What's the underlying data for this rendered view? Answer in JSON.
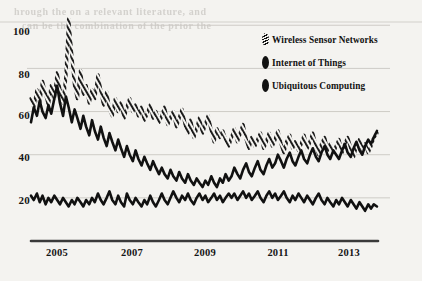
{
  "chart_data": {
    "type": "line",
    "title": "",
    "subtitle": "",
    "xlabel": "",
    "ylabel": "",
    "xlim": [
      2004.25,
      2014.2
    ],
    "ylim": [
      0,
      108
    ],
    "grid": true,
    "legend_position": "top-right",
    "x_tick_labels": [
      "2005",
      "2007",
      "2009",
      "2011",
      "2013"
    ],
    "x_tick_values": [
      2005,
      2007,
      2009,
      2011,
      2013
    ],
    "y_tick_labels": [
      "100",
      "80",
      "60",
      "40",
      "20"
    ],
    "y_tick_values": [
      100,
      80,
      60,
      40,
      20
    ],
    "x": [
      2004.25,
      2004.33,
      2004.42,
      2004.5,
      2004.58,
      2004.67,
      2004.75,
      2004.83,
      2004.92,
      2005.0,
      2005.08,
      2005.17,
      2005.25,
      2005.33,
      2005.42,
      2005.5,
      2005.58,
      2005.67,
      2005.75,
      2005.83,
      2005.92,
      2006.0,
      2006.08,
      2006.17,
      2006.25,
      2006.33,
      2006.42,
      2006.5,
      2006.58,
      2006.67,
      2006.75,
      2006.83,
      2006.92,
      2007.0,
      2007.08,
      2007.17,
      2007.25,
      2007.33,
      2007.42,
      2007.5,
      2007.58,
      2007.67,
      2007.75,
      2007.83,
      2007.92,
      2008.0,
      2008.08,
      2008.17,
      2008.25,
      2008.33,
      2008.42,
      2008.5,
      2008.58,
      2008.67,
      2008.75,
      2008.83,
      2008.92,
      2009.0,
      2009.08,
      2009.17,
      2009.25,
      2009.33,
      2009.42,
      2009.5,
      2009.58,
      2009.67,
      2009.75,
      2009.83,
      2009.92,
      2010.0,
      2010.08,
      2010.17,
      2010.25,
      2010.33,
      2010.42,
      2010.5,
      2010.58,
      2010.67,
      2010.75,
      2010.83,
      2010.92,
      2011.0,
      2011.08,
      2011.17,
      2011.25,
      2011.33,
      2011.42,
      2011.5,
      2011.58,
      2011.67,
      2011.75,
      2011.83,
      2011.92,
      2012.0,
      2012.08,
      2012.17,
      2012.25,
      2012.33,
      2012.42,
      2012.5,
      2012.58,
      2012.67,
      2012.75,
      2012.83,
      2012.92,
      2013.0,
      2013.08,
      2013.17,
      2013.25,
      2013.33,
      2013.42,
      2013.5,
      2013.58,
      2013.67,
      2013.75,
      2013.83,
      2013.92,
      2014.0,
      2014.08,
      2014.17
    ],
    "series": [
      {
        "name": "Wireless Sensor Networks",
        "style": "hatched",
        "values": [
          66,
          62,
          70,
          64,
          74,
          68,
          63,
          72,
          66,
          78,
          70,
          64,
          76,
          103,
          86,
          72,
          66,
          79,
          68,
          72,
          64,
          70,
          66,
          77,
          70,
          63,
          69,
          61,
          58,
          66,
          60,
          64,
          57,
          62,
          66,
          60,
          63,
          58,
          62,
          56,
          59,
          63,
          57,
          60,
          55,
          58,
          62,
          54,
          57,
          60,
          53,
          57,
          61,
          54,
          50,
          56,
          48,
          52,
          57,
          50,
          54,
          58,
          51,
          46,
          52,
          48,
          51,
          47,
          44,
          48,
          52,
          46,
          50,
          54,
          47,
          43,
          48,
          44,
          47,
          50,
          43,
          46,
          50,
          44,
          47,
          51,
          45,
          41,
          46,
          49,
          43,
          46,
          42,
          45,
          49,
          43,
          46,
          50,
          44,
          40,
          45,
          48,
          42,
          45,
          41,
          44,
          47,
          41,
          45,
          48,
          43,
          39,
          44,
          47,
          42,
          45,
          41,
          44,
          48,
          50
        ]
      },
      {
        "name": "Internet of Things",
        "style": "solid",
        "values": [
          55,
          62,
          58,
          65,
          60,
          57,
          63,
          59,
          66,
          72,
          64,
          58,
          67,
          62,
          55,
          61,
          57,
          52,
          58,
          53,
          49,
          56,
          51,
          47,
          53,
          48,
          44,
          50,
          46,
          42,
          47,
          43,
          39,
          44,
          40,
          37,
          42,
          38,
          35,
          39,
          36,
          33,
          37,
          34,
          31,
          34,
          31,
          29,
          33,
          30,
          28,
          32,
          29,
          27,
          31,
          28,
          26,
          29,
          27,
          25,
          28,
          26,
          30,
          27,
          25,
          29,
          27,
          31,
          28,
          30,
          34,
          31,
          29,
          33,
          36,
          32,
          30,
          34,
          37,
          33,
          31,
          35,
          38,
          34,
          36,
          40,
          37,
          34,
          38,
          41,
          37,
          35,
          39,
          42,
          38,
          36,
          40,
          43,
          39,
          37,
          41,
          44,
          40,
          38,
          42,
          40,
          38,
          42,
          45,
          41,
          39,
          43,
          46,
          42,
          40,
          44,
          47,
          45,
          48,
          51
        ]
      },
      {
        "name": "Ubiquitous Computing",
        "style": "solid",
        "values": [
          21,
          19,
          22,
          18,
          21,
          17,
          20,
          18,
          21,
          19,
          17,
          20,
          18,
          16,
          19,
          17,
          20,
          18,
          16,
          19,
          17,
          20,
          18,
          22,
          19,
          17,
          20,
          23,
          19,
          17,
          21,
          18,
          16,
          22,
          19,
          17,
          20,
          18,
          16,
          19,
          17,
          21,
          18,
          16,
          19,
          22,
          19,
          17,
          20,
          23,
          20,
          18,
          21,
          19,
          22,
          19,
          17,
          20,
          22,
          19,
          21,
          18,
          20,
          22,
          19,
          21,
          18,
          20,
          22,
          20,
          22,
          19,
          21,
          23,
          20,
          22,
          19,
          21,
          23,
          20,
          18,
          21,
          23,
          20,
          22,
          19,
          21,
          23,
          20,
          18,
          21,
          19,
          22,
          20,
          18,
          21,
          19,
          17,
          20,
          22,
          19,
          17,
          20,
          18,
          16,
          19,
          17,
          20,
          18,
          16,
          19,
          17,
          15,
          18,
          16,
          14,
          17,
          15,
          17,
          16
        ]
      }
    ]
  },
  "legend": {
    "items": [
      {
        "label": "Wireless Sensor Networks",
        "marker": "hatched-ellipse-marker"
      },
      {
        "label": "Internet of Things",
        "marker": "solid-ellipse-marker"
      },
      {
        "label": "Ubiquitous Computing",
        "marker": "solid-ellipse-marker"
      }
    ]
  },
  "axes": {
    "y_ticks": [
      "100",
      "80",
      "60",
      "40",
      "20"
    ],
    "x_ticks": [
      "2005",
      "2007",
      "2009",
      "2011",
      "2013"
    ]
  },
  "colors": {
    "ink": "#111111",
    "paper": "#f4f3f0",
    "gridline": "#c9c7c2",
    "axis": "#3a3a3a"
  },
  "artifacts": {
    "bleed_lines": [
      "hrough the on a relevant literature, and",
      "can be the combination of the prior the"
    ]
  }
}
